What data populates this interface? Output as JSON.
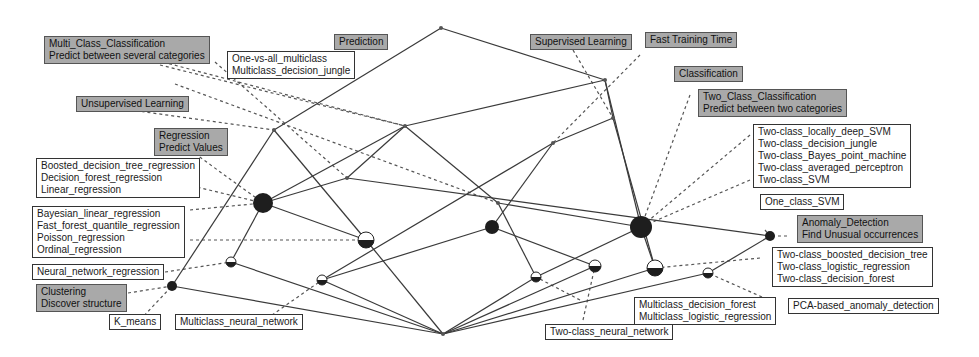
{
  "diagram": {
    "type": "concept-lattice",
    "colors": {
      "edge": "#3a3a3a",
      "dashed": "#555555",
      "attr_label_bg": "#a9a9a9",
      "obj_label_bg": "#ffffff",
      "node_dark": "#1e1e1e"
    },
    "nodes": [
      {
        "id": "top",
        "x": 441,
        "y": 28,
        "r": 2,
        "style": "point"
      },
      {
        "id": "supervised",
        "x": 605,
        "y": 80,
        "r": 2,
        "style": "point"
      },
      {
        "id": "fast",
        "x": 613,
        "y": 118,
        "r": 2,
        "style": "point"
      },
      {
        "id": "prediction",
        "x": 405,
        "y": 126,
        "r": 2,
        "style": "point"
      },
      {
        "id": "unsupervised",
        "x": 274,
        "y": 130,
        "r": 2,
        "style": "point"
      },
      {
        "id": "classification",
        "x": 553,
        "y": 143,
        "r": 2,
        "style": "point"
      },
      {
        "id": "multi",
        "x": 347,
        "y": 178,
        "r": 2,
        "style": "point"
      },
      {
        "id": "pred_class",
        "x": 498,
        "y": 203,
        "r": 2,
        "style": "point"
      },
      {
        "id": "regression",
        "x": 263,
        "y": 203,
        "r": 10,
        "style": "dark"
      },
      {
        "id": "two_class",
        "x": 641,
        "y": 227,
        "r": 11,
        "style": "dark"
      },
      {
        "id": "multi_class_obj",
        "x": 492,
        "y": 227,
        "r": 7,
        "style": "dark"
      },
      {
        "id": "anomaly",
        "x": 770,
        "y": 236,
        "r": 5,
        "style": "dark"
      },
      {
        "id": "dfr",
        "x": 366,
        "y": 240,
        "r": 8,
        "style": "half"
      },
      {
        "id": "nnr",
        "x": 231,
        "y": 262,
        "r": 5,
        "style": "half"
      },
      {
        "id": "mnn",
        "x": 322,
        "y": 280,
        "r": 5,
        "style": "half"
      },
      {
        "id": "mdf",
        "x": 536,
        "y": 277,
        "r": 5,
        "style": "half"
      },
      {
        "id": "tcnn",
        "x": 595,
        "y": 266,
        "r": 6,
        "style": "half"
      },
      {
        "id": "tcbdt",
        "x": 655,
        "y": 268,
        "r": 8,
        "style": "half"
      },
      {
        "id": "pca",
        "x": 708,
        "y": 273,
        "r": 5,
        "style": "half"
      },
      {
        "id": "clustering",
        "x": 172,
        "y": 286,
        "r": 5,
        "style": "dark"
      },
      {
        "id": "bottom",
        "x": 443,
        "y": 334,
        "r": 2,
        "style": "point"
      }
    ],
    "edges": [
      [
        "top",
        "supervised"
      ],
      [
        "top",
        "unsupervised"
      ],
      [
        "supervised",
        "fast"
      ],
      [
        "supervised",
        "two_class"
      ],
      [
        "supervised",
        "prediction"
      ],
      [
        "fast",
        "classification"
      ],
      [
        "fast",
        "tcbdt"
      ],
      [
        "prediction",
        "multi"
      ],
      [
        "prediction",
        "regression"
      ],
      [
        "prediction",
        "pred_class"
      ],
      [
        "unsupervised",
        "clustering"
      ],
      [
        "unsupervised",
        "dfr"
      ],
      [
        "classification",
        "multi_class_obj"
      ],
      [
        "classification",
        "mnn"
      ],
      [
        "multi",
        "regression"
      ],
      [
        "multi",
        "anomaly"
      ],
      [
        "pred_class",
        "two_class"
      ],
      [
        "pred_class",
        "mdf"
      ],
      [
        "regression",
        "nnr"
      ],
      [
        "regression",
        "dfr"
      ],
      [
        "two_class",
        "tcbdt"
      ],
      [
        "two_class",
        "mdf"
      ],
      [
        "anomaly",
        "pca"
      ],
      [
        "multi_class_obj",
        "mnn"
      ],
      [
        "multi_class_obj",
        "tcnn"
      ],
      [
        "dfr",
        "bottom"
      ],
      [
        "nnr",
        "bottom"
      ],
      [
        "mnn",
        "bottom"
      ],
      [
        "mdf",
        "bottom"
      ],
      [
        "tcnn",
        "bottom"
      ],
      [
        "tcbdt",
        "bottom"
      ],
      [
        "pca",
        "bottom"
      ],
      [
        "clustering",
        "bottom"
      ]
    ],
    "dashed": [
      [
        140,
        56,
        405,
        126
      ],
      [
        88,
        104,
        274,
        130
      ],
      [
        215,
        62,
        347,
        178
      ],
      [
        175,
        84,
        498,
        203
      ],
      [
        190,
        150,
        263,
        203
      ],
      [
        180,
        183,
        263,
        203
      ],
      [
        190,
        210,
        263,
        203
      ],
      [
        190,
        240,
        366,
        240
      ],
      [
        165,
        272,
        231,
        262
      ],
      [
        128,
        293,
        172,
        286
      ],
      [
        140,
        320,
        172,
        286
      ],
      [
        262,
        322,
        322,
        280
      ],
      [
        573,
        50,
        613,
        118
      ],
      [
        640,
        55,
        553,
        143
      ],
      [
        690,
        95,
        641,
        227
      ],
      [
        750,
        135,
        641,
        227
      ],
      [
        750,
        180,
        641,
        227
      ],
      [
        765,
        230,
        770,
        236
      ],
      [
        787,
        236,
        770,
        236
      ],
      [
        760,
        258,
        655,
        268
      ],
      [
        762,
        297,
        708,
        273
      ],
      [
        580,
        300,
        536,
        277
      ],
      [
        583,
        320,
        595,
        266
      ],
      [
        160,
        65,
        405,
        126
      ]
    ],
    "labels": [
      {
        "id": "multi_class_classification",
        "kind": "attr",
        "x": 44,
        "y": 36,
        "lines": [
          "Multi_Class_Classification",
          "Predict between several categories"
        ]
      },
      {
        "id": "prediction",
        "kind": "attr",
        "x": 334,
        "y": 34,
        "lines": [
          "Prediction"
        ]
      },
      {
        "id": "one_vs_all",
        "kind": "obj",
        "x": 227,
        "y": 51,
        "lines": [
          "One-vs-all_multiclass",
          "Multiclass_decision_jungle"
        ]
      },
      {
        "id": "supervised_learning",
        "kind": "attr",
        "x": 530,
        "y": 34,
        "lines": [
          "Supervised Learning"
        ]
      },
      {
        "id": "fast_training_time",
        "kind": "attr",
        "x": 645,
        "y": 32,
        "lines": [
          "Fast Training Time"
        ]
      },
      {
        "id": "classification",
        "kind": "attr",
        "x": 674,
        "y": 66,
        "lines": [
          "Classification"
        ]
      },
      {
        "id": "unsupervised_learning",
        "kind": "attr",
        "x": 76,
        "y": 96,
        "lines": [
          "Unsupervised Learning"
        ]
      },
      {
        "id": "two_class_classification",
        "kind": "attr",
        "x": 698,
        "y": 89,
        "lines": [
          "Two_Class_Classification",
          "Predict between two categories"
        ]
      },
      {
        "id": "regression",
        "kind": "attr",
        "x": 154,
        "y": 128,
        "lines": [
          "Regression",
          "Predict Values"
        ]
      },
      {
        "id": "boosted_regression",
        "kind": "obj",
        "x": 36,
        "y": 158,
        "lines": [
          "Boosted_decision_tree_regression",
          "Decision_forest_regression",
          "Linear_regression"
        ]
      },
      {
        "id": "two_class_svm_group",
        "kind": "obj",
        "x": 753,
        "y": 124,
        "lines": [
          "Two-class_locally_deep_SVM",
          "Two-class_decision_jungle",
          "Two-class_Bayes_point_machine",
          "Two-class_averaged_perceptron",
          "Two-class_SVM"
        ]
      },
      {
        "id": "bayesian_regression",
        "kind": "obj",
        "x": 32,
        "y": 206,
        "lines": [
          "Bayesian_linear_regression",
          "Fast_forest_quantile_regression",
          "Poisson_regression",
          "Ordinal_regression"
        ]
      },
      {
        "id": "one_class_svm",
        "kind": "obj",
        "x": 760,
        "y": 194,
        "lines": [
          "One_class_SVM"
        ]
      },
      {
        "id": "anomaly_detection",
        "kind": "attr",
        "x": 797,
        "y": 215,
        "lines": [
          "Anomaly_Detection",
          "Find Unusual occurrences"
        ]
      },
      {
        "id": "neural_network_regression",
        "kind": "obj",
        "x": 32,
        "y": 264,
        "lines": [
          "Neural_network_regression"
        ]
      },
      {
        "id": "two_class_boosted_group",
        "kind": "obj",
        "x": 772,
        "y": 247,
        "lines": [
          "Two-class_boosted_decision_tree",
          "Two-class_logistic_regression",
          "Two-class_decision_forest"
        ]
      },
      {
        "id": "clustering",
        "kind": "attr",
        "x": 36,
        "y": 284,
        "lines": [
          "Clustering",
          "Discover structure"
        ]
      },
      {
        "id": "pca_anomaly",
        "kind": "obj",
        "x": 788,
        "y": 298,
        "lines": [
          "PCA-based_anomaly_detection"
        ]
      },
      {
        "id": "multiclass_forest_group",
        "kind": "obj",
        "x": 634,
        "y": 297,
        "lines": [
          "Multiclass_decision_forest",
          "Multiclass_logistic_regression"
        ]
      },
      {
        "id": "k_means",
        "kind": "obj",
        "x": 109,
        "y": 314,
        "lines": [
          "K_means"
        ]
      },
      {
        "id": "multiclass_neural_network",
        "kind": "obj",
        "x": 175,
        "y": 314,
        "lines": [
          "Multiclass_neural_network"
        ]
      },
      {
        "id": "two_class_neural_network",
        "kind": "obj",
        "x": 545,
        "y": 324,
        "lines": [
          "Two-class_neural_network"
        ]
      }
    ]
  }
}
